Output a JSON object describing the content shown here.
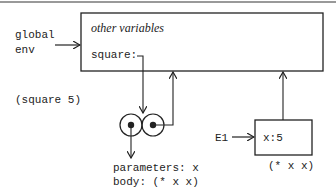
{
  "global_env": {
    "label_line1": "global",
    "label_line2": "env",
    "frame_text": "other variables",
    "binding": "square:"
  },
  "call": {
    "expression": "(square 5)"
  },
  "procedure": {
    "parameters": "parameters: x",
    "body": "body: (* x x)"
  },
  "e1": {
    "label": "E1",
    "binding": "x:5",
    "expression": "(* x x)"
  },
  "colors": {
    "stroke": "#222222",
    "rule": "#999999"
  }
}
